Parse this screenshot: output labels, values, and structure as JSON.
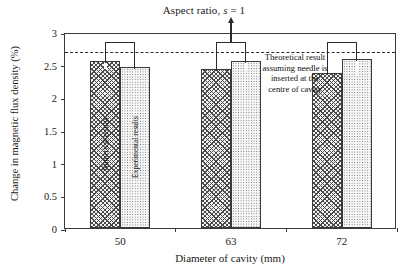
{
  "chart_data": {
    "type": "bar",
    "title": "Aspect ratio, s = 1",
    "title_parts": {
      "lead": "Aspect ratio,",
      "italic": "s",
      "tail": "= 1"
    },
    "xlabel": "Diameter of cavity (mm)",
    "ylabel": "Change in magnetic flux density (%)",
    "categories": [
      "50",
      "63",
      "72"
    ],
    "ylim": [
      0,
      3
    ],
    "yticks": [
      "0",
      "0.5",
      "1",
      "1.5",
      "2",
      "2.5",
      "3"
    ],
    "ytick_values": [
      0,
      0.5,
      1,
      1.5,
      2,
      2.5,
      3
    ],
    "grid": false,
    "legend_position": "in-bar-vertical-labels",
    "series": [
      {
        "name": "Numerical results",
        "values": [
          2.56,
          2.44,
          2.37
        ],
        "fill": "cross-hatch"
      },
      {
        "name": "Experimental results",
        "values": [
          2.47,
          2.55,
          2.58
        ],
        "fill": "dotted"
      }
    ],
    "brackets": {
      "label": "group-bracket",
      "tops": [
        2.88,
        2.88,
        2.88
      ]
    },
    "reference_line": {
      "value": 2.73,
      "style": "dashed",
      "label": "Theoretical result assuming needle is inserted at the centre of cavity"
    },
    "annotation": {
      "lines": [
        "Theoretical result",
        "assuming needle is",
        "inserted at the",
        "centre of cavity"
      ]
    },
    "arrow": {
      "name": "aspect-ratio-callout-arrow",
      "from_group": "63"
    }
  },
  "colors": {
    "axis": "#3a3a3a",
    "line": "#2b2b2b",
    "text": "#1a1a1a",
    "background": "#ffffff"
  }
}
